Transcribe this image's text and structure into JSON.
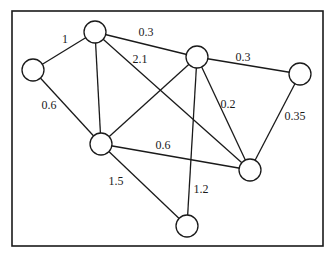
{
  "diagram": {
    "type": "weighted-undirected-graph",
    "nodes": [
      {
        "id": "A",
        "x": 33,
        "y": 70
      },
      {
        "id": "B",
        "x": 95,
        "y": 32
      },
      {
        "id": "C",
        "x": 197,
        "y": 57
      },
      {
        "id": "D",
        "x": 300,
        "y": 74
      },
      {
        "id": "E",
        "x": 101,
        "y": 144
      },
      {
        "id": "F",
        "x": 250,
        "y": 170
      },
      {
        "id": "G",
        "x": 187,
        "y": 226
      }
    ],
    "edges": [
      {
        "from": "A",
        "to": "B",
        "weight": "1",
        "lx": 65,
        "ly": 40
      },
      {
        "from": "A",
        "to": "E",
        "weight": "0.6",
        "lx": 49,
        "ly": 106
      },
      {
        "from": "B",
        "to": "C",
        "weight": "0.3",
        "lx": 146,
        "ly": 33
      },
      {
        "from": "B",
        "to": "E",
        "weight": "",
        "lx": null,
        "ly": null
      },
      {
        "from": "B",
        "to": "F",
        "weight": "2.1",
        "lx": 140,
        "ly": 60
      },
      {
        "from": "C",
        "to": "E",
        "weight": "",
        "lx": null,
        "ly": null
      },
      {
        "from": "C",
        "to": "D",
        "weight": "0.3",
        "lx": 243,
        "ly": 58
      },
      {
        "from": "C",
        "to": "F",
        "weight": "0.2",
        "lx": 228,
        "ly": 105
      },
      {
        "from": "C",
        "to": "G",
        "weight": "1.2",
        "lx": 201,
        "ly": 190
      },
      {
        "from": "D",
        "to": "F",
        "weight": "0.35",
        "lx": 295,
        "ly": 117
      },
      {
        "from": "E",
        "to": "F",
        "weight": "0.6",
        "lx": 163,
        "ly": 146
      },
      {
        "from": "E",
        "to": "G",
        "weight": "1.5",
        "lx": 116,
        "ly": 182
      }
    ],
    "node_radius": 11
  }
}
